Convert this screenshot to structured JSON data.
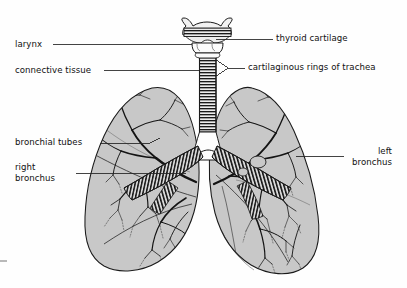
{
  "diagram": {
    "type": "anatomical-line-illustration",
    "background_color": "#fefefe",
    "lung_fill_color": "#c8c8c8",
    "outline_color": "#1a1a1a",
    "leader_line_color": "#222222"
  },
  "labels": {
    "larynx": "larynx",
    "connective_tissue": "connective tissue",
    "bronchial_tubes": "bronchial tubes",
    "right_bronchus_line1": "right",
    "right_bronchus_line2": "bronchus",
    "thyroid_cartilage": "thyroid cartilage",
    "cartilaginous_rings": "cartilaginous rings of trachea",
    "left_bronchus_line1": "left",
    "left_bronchus_line2": "bronchus"
  },
  "structures": {
    "thyroid_cartilage": "thyroid-cartilage",
    "trachea": "trachea",
    "carina": "carina",
    "right_lung": "right-lung",
    "left_lung": "left-lung",
    "right_main_bronchus": "right-main-bronchus",
    "left_main_bronchus": "left-main-bronchus",
    "bronchial_tree": "bronchial-tree"
  }
}
